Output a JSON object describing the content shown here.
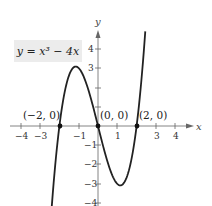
{
  "chart_data": {
    "type": "line",
    "title": "",
    "equation": "y = x³ − 4x",
    "xlabel": "x",
    "ylabel": "y",
    "xlim": [
      -4.5,
      4.6
    ],
    "ylim": [
      -4.2,
      4.9
    ],
    "x_ticks": [
      -4,
      -3,
      -2,
      -1,
      1,
      2,
      3,
      4
    ],
    "x_tick_labels": [
      "−4",
      "−3",
      "",
      "−1",
      "1",
      "",
      "3",
      "4"
    ],
    "y_ticks": [
      -4,
      -3,
      -2,
      -1,
      1,
      2,
      3,
      4
    ],
    "y_tick_labels": [
      "−4",
      "−3",
      "−2",
      "−1",
      "",
      "",
      "3",
      "4"
    ],
    "grid": false,
    "series": [
      {
        "name": "y = x^3 - 4x",
        "x_range": [
          -2.42,
          2.45
        ],
        "color": "#222222",
        "sample_points": [
          {
            "x": -2.4,
            "y": -4.22
          },
          {
            "x": -2,
            "y": 0
          },
          {
            "x": -1.15,
            "y": 3.08
          },
          {
            "x": 0,
            "y": 0
          },
          {
            "x": 1.15,
            "y": -3.08
          },
          {
            "x": 2,
            "y": 0
          },
          {
            "x": 2.45,
            "y": 4.9
          }
        ]
      }
    ],
    "annotations": [
      {
        "label": "(−2, 0)",
        "x": -2,
        "y": 0
      },
      {
        "label": "(0, 0)",
        "x": 0,
        "y": 0
      },
      {
        "label": "(2, 0)",
        "x": 2,
        "y": 0
      }
    ]
  },
  "labels": {
    "equation": "y = x³ − 4x",
    "x_axis": "x",
    "y_axis": "y",
    "pt_neg2": "(−2, 0)",
    "pt_0": "(0, 0)",
    "pt_2": "(2, 0)",
    "xt_n4": "−4",
    "xt_n3": "−3",
    "xt_n1": "−1",
    "xt_1": "1",
    "xt_3": "3",
    "xt_4": "4",
    "yt_4": "4",
    "yt_3": "3",
    "yt_n1": "−1",
    "yt_n2": "−2",
    "yt_n3": "−3",
    "yt_n4": "−4"
  }
}
